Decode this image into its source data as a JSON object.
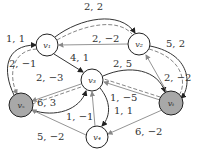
{
  "nodes": [
    {
      "id": "v1",
      "label": "v₁",
      "shaded": false
    },
    {
      "id": "v2",
      "label": "v₂",
      "shaded": false
    },
    {
      "id": "v3",
      "label": "v₃",
      "shaded": false
    },
    {
      "id": "v4",
      "label": "v₄",
      "shaded": false
    },
    {
      "id": "vs",
      "label": "vₛ",
      "shaded": true
    },
    {
      "id": "vt",
      "label": "vₜ",
      "shaded": true
    }
  ],
  "edges": [
    {
      "from": "vs",
      "to": "v1",
      "label": "1, 1"
    },
    {
      "from": "v1",
      "to": "vs",
      "label": "2, −1"
    },
    {
      "from": "v1",
      "to": "v2",
      "label": "2, 2"
    },
    {
      "from": "v2",
      "to": "v1",
      "label": "2, −2"
    },
    {
      "from": "v1",
      "to": "v3",
      "label": "4, 1"
    },
    {
      "from": "v3",
      "to": "vt",
      "label": "2, 5"
    },
    {
      "from": "vt",
      "to": "v3",
      "label": "1, −5"
    },
    {
      "from": "v2",
      "to": "vt",
      "label": "5, 2"
    },
    {
      "from": "vt",
      "to": "v2",
      "label": "2, −2"
    },
    {
      "from": "v3",
      "to": "vs",
      "label": "2, −3"
    },
    {
      "from": "vs",
      "to": "v3",
      "label": "6, 3"
    },
    {
      "from": "v4",
      "to": "v3",
      "label": "1, −1"
    },
    {
      "from": "v3",
      "to": "v4",
      "label": "1, 1"
    },
    {
      "from": "v4",
      "to": "vs",
      "label": "5, −2"
    },
    {
      "from": "vt",
      "to": "v4",
      "label": "6, −2"
    }
  ]
}
